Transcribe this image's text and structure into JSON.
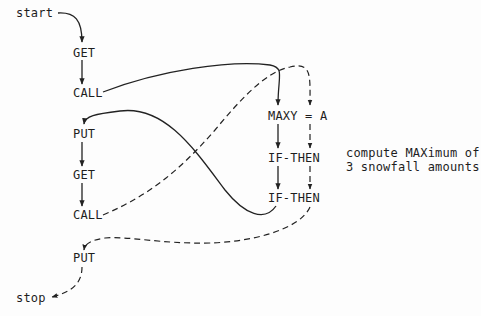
{
  "diagram": {
    "entry": "start",
    "exit": "stop",
    "main_flow": [
      {
        "id": "get1",
        "label": "GET"
      },
      {
        "id": "call1",
        "label": "CALL"
      },
      {
        "id": "put1",
        "label": "PUT"
      },
      {
        "id": "get2",
        "label": "GET"
      },
      {
        "id": "call2",
        "label": "CALL"
      },
      {
        "id": "put2",
        "label": "PUT"
      }
    ],
    "subroutine": [
      {
        "id": "maxy",
        "label": "MAXY = A"
      },
      {
        "id": "if1",
        "label": "IF-THEN"
      },
      {
        "id": "if2",
        "label": "IF-THEN"
      }
    ],
    "annotation": {
      "line1": "compute MAXimum of",
      "line2": "3 snowfall amounts"
    },
    "edges": [
      {
        "from": "start",
        "to": "get1",
        "style": "solid"
      },
      {
        "from": "get1",
        "to": "call1",
        "style": "solid"
      },
      {
        "from": "call1",
        "to": "maxy",
        "style": "solid"
      },
      {
        "from": "maxy",
        "to": "if1",
        "style": "solid"
      },
      {
        "from": "if1",
        "to": "if2",
        "style": "solid"
      },
      {
        "from": "if2",
        "to": "put1",
        "style": "solid"
      },
      {
        "from": "put1",
        "to": "get2",
        "style": "solid"
      },
      {
        "from": "get2",
        "to": "call2",
        "style": "solid"
      },
      {
        "from": "call2",
        "to": "maxy",
        "style": "dashed"
      },
      {
        "from": "maxy",
        "to": "if1",
        "style": "dashed"
      },
      {
        "from": "if1",
        "to": "if2",
        "style": "dashed"
      },
      {
        "from": "if2",
        "to": "put2",
        "style": "dashed"
      },
      {
        "from": "put2",
        "to": "stop",
        "style": "dashed"
      }
    ]
  }
}
